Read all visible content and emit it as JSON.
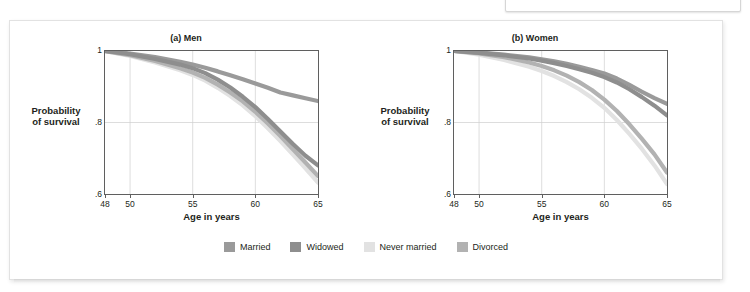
{
  "top_caption": {
    "text": "if god let him live.” [Lillard & Waite, 1995]"
  },
  "figure": {
    "panels": [
      {
        "title": "(a) Men",
        "xlabel": "Age in years",
        "ylabel_line1": "Probability",
        "ylabel_line2": "of survival"
      },
      {
        "title": "(b) Women",
        "xlabel": "Age in years",
        "ylabel_line1": "Probability",
        "ylabel_line2": "of survival"
      }
    ],
    "legend": [
      {
        "label": "Married",
        "color": "#9a9a9a"
      },
      {
        "label": "Widowed",
        "color": "#8e8e8e"
      },
      {
        "label": "Never married",
        "color": "#e2e2e2"
      },
      {
        "label": "Divorced",
        "color": "#b2b2b2"
      }
    ]
  },
  "chart_data": [
    {
      "type": "line",
      "title": "(a) Men",
      "xlabel": "Age in years",
      "ylabel": "Probability of survival",
      "xlim": [
        48,
        65
      ],
      "ylim": [
        0.6,
        1.0
      ],
      "xticks": [
        48,
        50,
        55,
        60,
        65
      ],
      "xtick_labels": [
        "48",
        "50",
        "55",
        "60",
        "65"
      ],
      "yticks": [
        0.6,
        0.8,
        1.0
      ],
      "ytick_labels": [
        ".6",
        ".8",
        "1"
      ],
      "grid": true,
      "legend_position": "bottom-shared",
      "x": [
        48,
        50,
        52,
        54,
        55,
        56,
        57,
        58,
        59,
        60,
        61,
        62,
        63,
        64,
        65
      ],
      "series": [
        {
          "name": "Married",
          "color": "#9a9a9a",
          "values": [
            1.0,
            0.993,
            0.983,
            0.97,
            0.962,
            0.953,
            0.943,
            0.932,
            0.921,
            0.909,
            0.897,
            0.884,
            0.876,
            0.868,
            0.86
          ]
        },
        {
          "name": "Widowed",
          "color": "#8e8e8e",
          "values": [
            1.0,
            0.991,
            0.978,
            0.962,
            0.952,
            0.938,
            0.92,
            0.898,
            0.872,
            0.843,
            0.81,
            0.775,
            0.74,
            0.707,
            0.68
          ]
        },
        {
          "name": "Never married",
          "color": "#e2e2e2",
          "values": [
            1.0,
            0.986,
            0.968,
            0.946,
            0.933,
            0.917,
            0.897,
            0.874,
            0.848,
            0.818,
            0.784,
            0.748,
            0.71,
            0.672,
            0.632
          ]
        },
        {
          "name": "Divorced",
          "color": "#b2b2b2",
          "values": [
            1.0,
            0.988,
            0.972,
            0.952,
            0.94,
            0.925,
            0.906,
            0.884,
            0.859,
            0.83,
            0.797,
            0.762,
            0.725,
            0.688,
            0.65
          ]
        }
      ]
    },
    {
      "type": "line",
      "title": "(b) Women",
      "xlabel": "Age in years",
      "ylabel": "Probability of survival",
      "xlim": [
        48,
        65
      ],
      "ylim": [
        0.6,
        1.0
      ],
      "xticks": [
        48,
        50,
        55,
        60,
        65
      ],
      "xtick_labels": [
        "48",
        "50",
        "55",
        "60",
        "65"
      ],
      "yticks": [
        0.6,
        0.8,
        1.0
      ],
      "ytick_labels": [
        ".6",
        ".8",
        "1"
      ],
      "grid": true,
      "legend_position": "bottom-shared",
      "x": [
        48,
        50,
        52,
        54,
        55,
        56,
        57,
        58,
        59,
        60,
        61,
        62,
        63,
        64,
        65
      ],
      "series": [
        {
          "name": "Married",
          "color": "#9a9a9a",
          "values": [
            1.0,
            0.996,
            0.99,
            0.982,
            0.977,
            0.971,
            0.964,
            0.956,
            0.947,
            0.937,
            0.923,
            0.905,
            0.886,
            0.868,
            0.852
          ]
        },
        {
          "name": "Widowed",
          "color": "#8e8e8e",
          "values": [
            1.0,
            0.995,
            0.988,
            0.979,
            0.973,
            0.966,
            0.958,
            0.949,
            0.939,
            0.927,
            0.912,
            0.893,
            0.871,
            0.847,
            0.82
          ]
        },
        {
          "name": "Never married",
          "color": "#e2e2e2",
          "values": [
            1.0,
            0.99,
            0.975,
            0.956,
            0.944,
            0.93,
            0.913,
            0.893,
            0.869,
            0.841,
            0.807,
            0.768,
            0.726,
            0.68,
            0.628
          ]
        },
        {
          "name": "Divorced",
          "color": "#b2b2b2",
          "values": [
            1.0,
            0.993,
            0.983,
            0.968,
            0.958,
            0.946,
            0.931,
            0.913,
            0.891,
            0.864,
            0.832,
            0.795,
            0.754,
            0.711,
            0.66
          ]
        }
      ]
    }
  ]
}
